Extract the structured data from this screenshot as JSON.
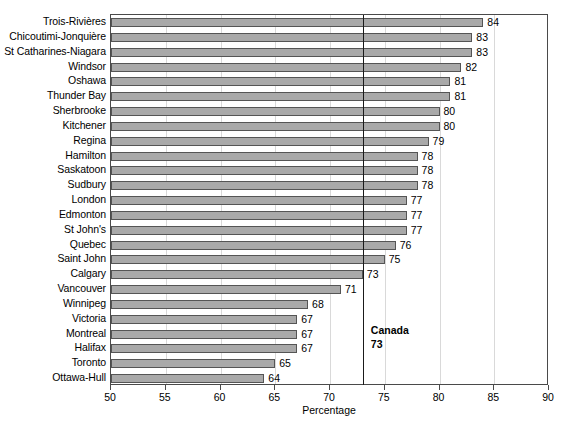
{
  "chart_data": {
    "type": "bar",
    "orientation": "horizontal",
    "title": "",
    "xlabel": "Percentage",
    "ylabel": "",
    "xlim": [
      50,
      90
    ],
    "xticks": [
      50,
      55,
      60,
      65,
      70,
      75,
      80,
      85,
      90
    ],
    "grid": true,
    "legend": null,
    "categories": [
      "Trois-Rivières",
      "Chicoutimi-Jonquière",
      "St Catharines-Niagara",
      "Windsor",
      "Oshawa",
      "Thunder Bay",
      "Sherbrooke",
      "Kitchener",
      "Regina",
      "Hamilton",
      "Saskatoon",
      "Sudbury",
      "London",
      "Edmonton",
      "St John's",
      "Quebec",
      "Saint John",
      "Calgary",
      "Vancouver",
      "Winnipeg",
      "Victoria",
      "Montreal",
      "Halifax",
      "Toronto",
      "Ottawa-Hull"
    ],
    "values": [
      84,
      83,
      83,
      82,
      81,
      81,
      80,
      80,
      79,
      78,
      78,
      78,
      77,
      77,
      77,
      76,
      75,
      73,
      71,
      68,
      67,
      67,
      67,
      65,
      64
    ],
    "reference_line": {
      "label": "Canada",
      "value": 73,
      "value_text": "73"
    },
    "colors": {
      "bar_fill": "#a9a9a9",
      "bar_border": "#555555",
      "axis": "#4a4a4a",
      "gridline": "#d9d9d9",
      "reference_line": "#1a1a1a",
      "text": "#000000"
    }
  }
}
